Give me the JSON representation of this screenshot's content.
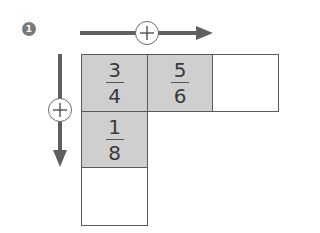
{
  "problem": {
    "number": "1"
  },
  "arrows": {
    "horizontal": {
      "operator": "+",
      "direction": "right"
    },
    "vertical": {
      "operator": "+",
      "direction": "down"
    }
  },
  "grid": {
    "cells": [
      {
        "row": 1,
        "col": 1,
        "numerator": "3",
        "denominator": "4",
        "shaded": true
      },
      {
        "row": 1,
        "col": 2,
        "numerator": "5",
        "denominator": "6",
        "shaded": true
      },
      {
        "row": 1,
        "col": 3,
        "numerator": "",
        "denominator": "",
        "shaded": false
      },
      {
        "row": 2,
        "col": 1,
        "numerator": "1",
        "denominator": "8",
        "shaded": true
      },
      {
        "row": 3,
        "col": 1,
        "numerator": "",
        "denominator": "",
        "shaded": false
      }
    ]
  },
  "colors": {
    "shade": "#cfcfcf",
    "arrow": "#5f5f5f",
    "border": "#5a5a5a",
    "badge": "#7a7a7a"
  }
}
